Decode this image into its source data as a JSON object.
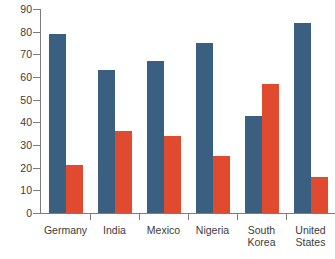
{
  "chart_data": {
    "type": "bar",
    "title": "",
    "subtitle": "",
    "xlabel": "",
    "ylabel": "",
    "categories": [
      "Germany",
      "India",
      "Mexico",
      "Nigeria",
      "South\nKorea",
      "United\nStates"
    ],
    "series": [
      {
        "name": "series-1",
        "color": "#3a5f80",
        "values": [
          79,
          63,
          67,
          75,
          43,
          84
        ]
      },
      {
        "name": "series-2",
        "color": "#e04a2f",
        "values": [
          21,
          36,
          34,
          25,
          57,
          16
        ]
      }
    ],
    "ylim": [
      0,
      90
    ],
    "yticks": [
      0,
      10,
      20,
      30,
      40,
      50,
      60,
      70,
      80,
      90
    ],
    "ytick_labels": [
      "0",
      "10",
      "20",
      "30",
      "40",
      "50",
      "60",
      "70",
      "80",
      "90"
    ],
    "grid": false,
    "legend": "none",
    "annotations": []
  },
  "colors": {
    "axis": "#7d7d7d",
    "text": "#3b3b3b",
    "background": "#ffffff",
    "series_1": "#3a5f80",
    "series_2": "#e04a2f"
  }
}
